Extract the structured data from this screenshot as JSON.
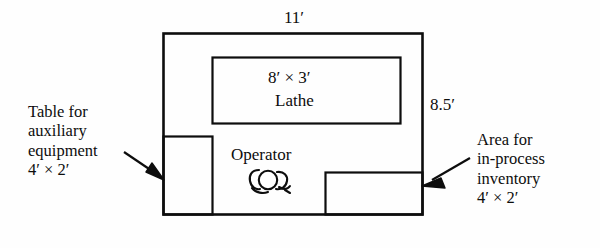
{
  "diagram": {
    "title_visible": false,
    "dimensions": {
      "top_label": "11′",
      "right_label": "8.5′"
    },
    "machine": {
      "size_label": "8′ × 3′",
      "name": "Lathe"
    },
    "operator": {
      "label": "Operator",
      "icon": "operator-top-view-icon"
    },
    "left_annotation": {
      "line1": "Table for",
      "line2": "auxiliary",
      "line3": "equipment",
      "line4": "4′ × 2′",
      "text": "Table for\nauxiliary\nequipment\n4′ × 2′"
    },
    "right_annotation": {
      "line1": "Area for",
      "line2": "in-process",
      "line3": "inventory",
      "line4": "4′ × 2′",
      "text": "Area for\nin-process\ninventory\n4′ × 2′"
    },
    "colors": {
      "ink": "#0d0d0d",
      "background": "#fefefe"
    }
  }
}
